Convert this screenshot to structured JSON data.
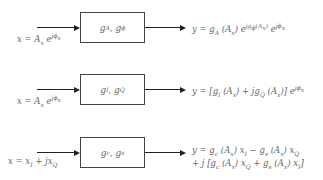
{
  "blocks": [
    {
      "input": "x = Aₓe^{jϕₓ}",
      "input_html_text": "x = Ax e jϕx",
      "box": "gA, gϕ",
      "output": "y = gA(Ax) e^{jgϕ(Ax)} e^{jϕx}",
      "output_text": "y = gA (Ax) e jgϕ(Ax) e jϕx"
    },
    {
      "input": "x = Aₓe^{jϕₓ}",
      "input_html_text": "x = Ax e jϕx",
      "box": "gI, gQ",
      "output": "y = [gI(Ax) + jgQ(Ax)] e^{jϕx}",
      "output_text": "y = [gI (Ax) + jgQ (Ax)] e jϕx"
    },
    {
      "input": "x = xI + jxQ",
      "input_html_text": "x = xI + jxQ",
      "box": "gc, gs",
      "output_line1": "y = gc(Ax)xI − gs(Ax)xQ",
      "output_line2": "+ j[gc(Ax)xQ + gs(Ax)xI]"
    }
  ]
}
